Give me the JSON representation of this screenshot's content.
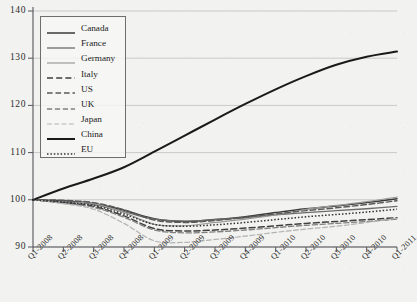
{
  "chart_data": {
    "type": "line",
    "title": "",
    "subtitle": "",
    "xlabel": "",
    "ylabel": "",
    "ylim": [
      90,
      140
    ],
    "yticks": [
      90,
      100,
      110,
      120,
      130,
      140
    ],
    "ytick_labels": [
      "90",
      "100",
      "110",
      "120",
      "130",
      "140"
    ],
    "grid": true,
    "legend_position": "top-left",
    "x": [
      "Q1-2008",
      "Q2-2008",
      "Q3-2008",
      "Q4-2008",
      "Q1-2009",
      "Q2-2009",
      "Q3-2009",
      "Q4-2009",
      "Q1-2010",
      "Q2-2010",
      "Q3-2010",
      "Q4-2010",
      "Q1-2011"
    ],
    "series": [
      {
        "name": "Canada",
        "style": "solid",
        "color": "#3a3a3a",
        "width": 1.5,
        "values": [
          100.0,
          99.8,
          99.2,
          97.8,
          96.0,
          95.4,
          95.8,
          96.4,
          97.3,
          98.1,
          98.7,
          99.4,
          100.2
        ]
      },
      {
        "name": "France",
        "style": "solid",
        "color": "#6b6b6b",
        "width": 1.3,
        "values": [
          100.0,
          99.6,
          99.0,
          97.5,
          95.9,
          95.5,
          95.8,
          96.2,
          96.8,
          97.3,
          97.7,
          98.1,
          98.6
        ]
      },
      {
        "name": "Germany",
        "style": "solid",
        "color": "#9a9a9a",
        "width": 1.2,
        "values": [
          100.0,
          99.5,
          99.2,
          97.3,
          94.8,
          94.5,
          95.2,
          95.9,
          96.8,
          98.0,
          98.8,
          99.6,
          100.6
        ]
      },
      {
        "name": "Italy",
        "style": "dashed",
        "color": "#3f3f3f",
        "width": 1.5,
        "values": [
          100.0,
          99.4,
          98.6,
          96.6,
          93.9,
          93.4,
          93.6,
          94.0,
          94.5,
          95.0,
          95.4,
          95.8,
          96.2
        ]
      },
      {
        "name": "US",
        "style": "dashed",
        "color": "#5a5a5a",
        "width": 1.4,
        "values": [
          100.0,
          99.9,
          99.4,
          97.9,
          95.7,
          95.2,
          95.6,
          96.3,
          97.0,
          97.7,
          98.3,
          99.0,
          99.8
        ]
      },
      {
        "name": "UK",
        "style": "dashed",
        "color": "#808080",
        "width": 1.3,
        "values": [
          100.0,
          99.3,
          98.4,
          96.3,
          93.6,
          93.0,
          93.2,
          93.6,
          94.1,
          94.6,
          95.0,
          95.4,
          95.9
        ]
      },
      {
        "name": "Japan",
        "style": "dashed",
        "color": "#b3b3b3",
        "width": 1.2,
        "values": [
          100.0,
          99.2,
          98.0,
          95.0,
          91.3,
          91.0,
          91.6,
          92.3,
          93.1,
          93.8,
          94.4,
          95.2,
          96.1
        ]
      },
      {
        "name": "China",
        "style": "solid",
        "color": "#1a1a1a",
        "width": 2.0,
        "values": [
          100.0,
          102.4,
          104.5,
          106.9,
          110.2,
          113.6,
          117.0,
          120.3,
          123.4,
          126.2,
          128.6,
          130.3,
          131.4
        ]
      },
      {
        "name": "EU",
        "style": "dotted",
        "color": "#303030",
        "width": 1.5,
        "values": [
          100.0,
          99.5,
          98.8,
          97.0,
          94.8,
          94.4,
          94.7,
          95.2,
          95.8,
          96.4,
          96.9,
          97.4,
          98.0
        ]
      }
    ]
  },
  "legend": {
    "entries": [
      {
        "label": "Canada"
      },
      {
        "label": "France"
      },
      {
        "label": "Germany"
      },
      {
        "label": "Italy"
      },
      {
        "label": "US"
      },
      {
        "label": "UK"
      },
      {
        "label": "Japan"
      },
      {
        "label": "China"
      },
      {
        "label": "EU"
      }
    ]
  },
  "axes": {
    "y_tick_labels": [
      "140",
      "130",
      "120",
      "110",
      "100",
      "90"
    ],
    "x_tick_labels": [
      "Q1-2008",
      "Q2-2008",
      "Q3-2008",
      "Q4-2008",
      "Q1-2009",
      "Q2-2009",
      "Q3-2009",
      "Q4-2009",
      "Q1-2010",
      "Q2-2010",
      "Q3-2010",
      "Q4-2010",
      "Q1-2011"
    ]
  },
  "colors": {
    "background": "#f2f2f0",
    "axis": "#55555a",
    "grid": "#b9b9bb",
    "legend_border": "#6e6e6e"
  }
}
